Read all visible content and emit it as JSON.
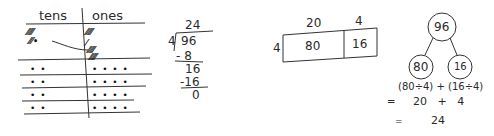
{
  "place_value_chart": {
    "headers": {
      "tens": "tens",
      "ones": "ones"
    },
    "row0": {
      "tens_top": "⁄⁄⁄⁄⁄",
      "tens_bottom": "⁄⁄⁄•",
      "ones_top": "⁄⁄⁄⁄⁄",
      "ones_mid": "⁄",
      "ones_b1": "⁄⁄⁄⁄⁄",
      "ones_b2": "⁄⁄⁄⁄⁄"
    },
    "rows": [
      {
        "tens": "• •",
        "ones": "• • • •"
      },
      {
        "tens": "• •",
        "ones": "• • • •"
      },
      {
        "tens": "• •",
        "ones": "• • • •"
      },
      {
        "tens": "• •",
        "ones": "• • • •"
      }
    ]
  },
  "long_division": {
    "quotient": "24",
    "divisor": "4",
    "dividend": "96",
    "step1": "- 8",
    "step2": "16",
    "step3": "-16",
    "remainder": "0"
  },
  "area_model": {
    "top_left": "20",
    "top_right": "4",
    "side": "4",
    "cell_left": "80",
    "cell_right": "16"
  },
  "number_bond": {
    "whole": "96",
    "part_left": "80",
    "part_right": "16",
    "expression": "(80÷4) + (16÷4)",
    "line2_eq": "=",
    "line2": "20   +   4",
    "line3_eq": "=",
    "line3": "24"
  }
}
